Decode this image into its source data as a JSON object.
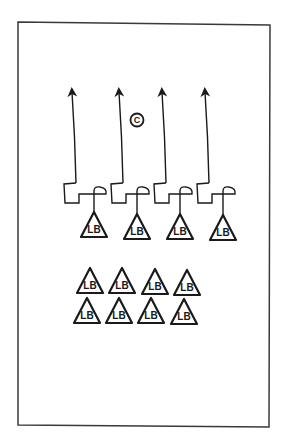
{
  "diagram": {
    "type": "play-diagram",
    "colors": {
      "stroke": "#1a1a1a",
      "background": "#ffffff",
      "frame": "#3a3a3a"
    },
    "frame": {
      "x": 18,
      "y": 22,
      "w": 252,
      "h": 405
    },
    "coach": {
      "label": "C",
      "x": 137,
      "y": 120,
      "r": 6.5
    },
    "routes": [
      {
        "tip": [
          72,
          90
        ],
        "bottom": [
          76,
          183
        ]
      },
      {
        "tip": [
          119,
          90
        ],
        "bottom": [
          123,
          183
        ]
      },
      {
        "tip": [
          162,
          90
        ],
        "bottom": [
          166,
          183
        ]
      },
      {
        "tip": [
          205,
          90
        ],
        "bottom": [
          209,
          183
        ]
      }
    ],
    "front_players": [
      {
        "label": "LB",
        "x": 94,
        "y": 212
      },
      {
        "label": "LB",
        "x": 137,
        "y": 214
      },
      {
        "label": "LB",
        "x": 180,
        "y": 214
      },
      {
        "label": "LB",
        "x": 223,
        "y": 215
      }
    ],
    "back_players": [
      {
        "label": "LB",
        "x": 90,
        "y": 268
      },
      {
        "label": "LB",
        "x": 122,
        "y": 268
      },
      {
        "label": "LB",
        "x": 155,
        "y": 269
      },
      {
        "label": "LB",
        "x": 187,
        "y": 270
      },
      {
        "label": "LB",
        "x": 87,
        "y": 298
      },
      {
        "label": "LB",
        "x": 119,
        "y": 298
      },
      {
        "label": "LB",
        "x": 151,
        "y": 298
      },
      {
        "label": "LB",
        "x": 184,
        "y": 299
      }
    ]
  }
}
